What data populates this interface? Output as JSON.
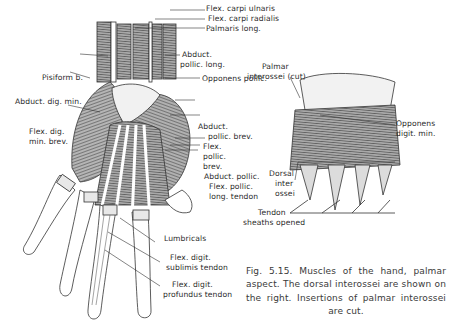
{
  "figure": {
    "number": "Fig. 5.15.",
    "caption": "Fig. 5.15. Muscles of the hand, palmar aspect. The dorsal interossei are shown on the right. Insertions of palmar interossei are cut."
  },
  "left_panel": {
    "labels": [
      {
        "id": "flex-carpi-ulnaris",
        "text": "Flex. carpi ulnaris"
      },
      {
        "id": "flex-carpi-radialis",
        "text": "Flex. carpi radialis"
      },
      {
        "id": "palmaris-long",
        "text": "Palmaris long."
      },
      {
        "id": "pisiform",
        "text": "Pisiform b."
      },
      {
        "id": "abduct-pollic-long-1",
        "text": "Abduct."
      },
      {
        "id": "abduct-pollic-long-2",
        "text": "pollic. long."
      },
      {
        "id": "abduct-dig-min",
        "text": "Abduct. dig. min."
      },
      {
        "id": "opponens-pollic",
        "text": "Opponens pollic."
      },
      {
        "id": "flex-dig-min-brev-1",
        "text": "Flex. dig."
      },
      {
        "id": "flex-dig-min-brev-2",
        "text": "min. brev."
      },
      {
        "id": "abduct-pollic-brev-1",
        "text": "Abduct."
      },
      {
        "id": "abduct-pollic-brev-2",
        "text": "pollic. brev."
      },
      {
        "id": "flex-pollic-brev-1",
        "text": "Flex."
      },
      {
        "id": "flex-pollic-brev-2",
        "text": "pollic."
      },
      {
        "id": "flex-pollic-brev-3",
        "text": "brev."
      },
      {
        "id": "abduct-pollic",
        "text": "Abduct. pollic."
      },
      {
        "id": "flex-pollic-long-tendon-1",
        "text": "Flex. pollic."
      },
      {
        "id": "flex-pollic-long-tendon-2",
        "text": "long. tendon"
      },
      {
        "id": "lumbricals",
        "text": "Lumbricals"
      },
      {
        "id": "flex-digit-sublimis-1",
        "text": "Flex. digit."
      },
      {
        "id": "flex-digit-sublimis-2",
        "text": "sublimis tendon"
      },
      {
        "id": "flex-digit-profundus-1",
        "text": "Flex. digit."
      },
      {
        "id": "flex-digit-profundus-2",
        "text": "profundus tendon"
      }
    ]
  },
  "right_panel": {
    "labels": [
      {
        "id": "palmar-interossei-1",
        "text": "Palmar"
      },
      {
        "id": "palmar-interossei-2",
        "text": "interossei (cut)"
      },
      {
        "id": "opponens-digit-min-1",
        "text": "Opponens"
      },
      {
        "id": "opponens-digit-min-2",
        "text": "digit. min."
      },
      {
        "id": "dorsal-interossei-1",
        "text": "Dorsal"
      },
      {
        "id": "dorsal-interossei-2",
        "text": "inter"
      },
      {
        "id": "dorsal-interossei-3",
        "text": "ossei"
      },
      {
        "id": "tendon-sheaths-1",
        "text": "Tendon"
      },
      {
        "id": "tendon-sheaths-2",
        "text": "sheaths opened"
      }
    ]
  },
  "colors": {
    "ink": "#2a2a2a",
    "muscle_fill": "#8a8a8a",
    "tendon_fill": "#ffffff",
    "background": "#ffffff"
  }
}
